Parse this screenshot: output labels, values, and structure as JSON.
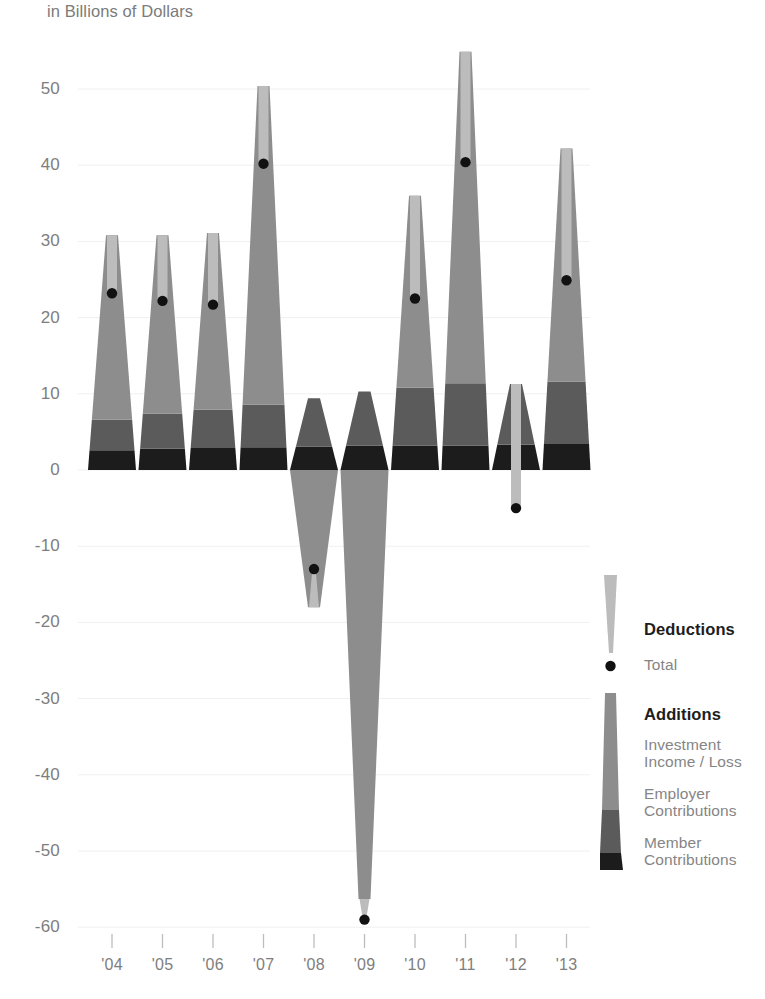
{
  "header": {
    "subtitle": "in Billions of Dollars"
  },
  "legend": {
    "deductions_title": "Deductions",
    "total_label": "Total",
    "additions_title": "Additions",
    "investment_label": "Investment\nIncome / Loss",
    "employer_label": "Employer\nContributions",
    "member_label": "Member\nContributions"
  },
  "colors": {
    "deductions": "#bcbcbc",
    "investment": "#8d8d8d",
    "employer": "#5b5b5b",
    "member": "#1c1c1c",
    "total_dot": "#111111",
    "axis_text": "#7e7e7e",
    "gridline": "#f0f0f0",
    "background": "#ffffff"
  },
  "chart_data": {
    "type": "bar",
    "title": "in Billions of Dollars",
    "subtitle": "in Billions of Dollars",
    "xlabel": "",
    "ylabel": "in Billions of Dollars",
    "stacked": true,
    "grid": true,
    "legend_position": "right",
    "categories": [
      "'04",
      "'05",
      "'06",
      "'07",
      "'08",
      "'09",
      "'10",
      "'11",
      "'12",
      "'13"
    ],
    "ylim": [
      -62,
      56
    ],
    "yticks": [
      50,
      40,
      30,
      20,
      10,
      0,
      -10,
      -20,
      -30,
      -40,
      -50,
      -60
    ],
    "ytick_labels": [
      "50",
      "40",
      "30",
      "20",
      "10",
      "0",
      "-10",
      "-20",
      "-30",
      "-40",
      "-50",
      "-60"
    ],
    "series": [
      {
        "name": "Member Contributions",
        "color": "#1c1c1c",
        "values": [
          2.6,
          2.8,
          2.9,
          3.0,
          3.1,
          3.2,
          3.2,
          3.2,
          3.3,
          3.4
        ]
      },
      {
        "name": "Employer Contributions",
        "color": "#5b5b5b",
        "values": [
          4.0,
          4.6,
          5.0,
          5.6,
          6.3,
          7.1,
          7.6,
          8.2,
          8.0,
          8.2
        ]
      },
      {
        "name": "Investment Income / Loss",
        "color": "#8d8d8d",
        "values": [
          24.2,
          23.4,
          23.2,
          41.8,
          -18.0,
          -56.3,
          25.2,
          43.5,
          0.0,
          30.6
        ]
      },
      {
        "name": "Deductions",
        "color": "#bcbcbc",
        "values": [
          -7.8,
          -8.8,
          -9.4,
          -10.2,
          -11.0,
          -11.8,
          -13.4,
          -14.5,
          -16.3,
          -17.3
        ]
      }
    ],
    "total": {
      "name": "Total",
      "color": "#111111",
      "values": [
        23.2,
        22.2,
        21.7,
        40.2,
        -13.0,
        -59.0,
        22.5,
        40.4,
        -5.0,
        24.9
      ]
    },
    "annotations": []
  },
  "geometry": {
    "y_zero_px": 470,
    "px_per_unit": 7.62,
    "plot_left": 88,
    "bar_pitch": 50.5,
    "bar_base_halfwidth": 24,
    "bar_top_halfwidth": 6,
    "deduction_halfwidth": 5
  }
}
